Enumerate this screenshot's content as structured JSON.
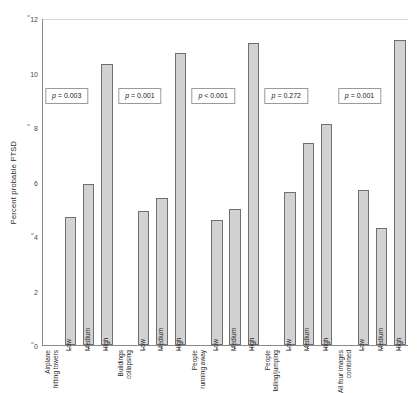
{
  "chart_data": {
    "type": "bar",
    "title": "",
    "xlabel": "",
    "ylabel": "Percent probable PTSD",
    "ylim": [
      0,
      12
    ],
    "yticks": [
      0,
      2,
      4,
      6,
      8,
      10,
      12
    ],
    "grid": false,
    "legend": "none",
    "categories": [
      "Low",
      "Medium",
      "High"
    ],
    "groups": [
      {
        "name": "Airplane hitting towers",
        "label_lines": [
          "Airplane",
          "hitting towers"
        ],
        "pvalue": "p = 0.003",
        "values": [
          4.7,
          5.9,
          10.3
        ]
      },
      {
        "name": "Buildings collapsing",
        "label_lines": [
          "Buildings",
          "collapsing"
        ],
        "pvalue": "p = 0.001",
        "values": [
          4.9,
          5.4,
          10.7
        ]
      },
      {
        "name": "People running away",
        "label_lines": [
          "People",
          "running away"
        ],
        "pvalue": "p < 0.001",
        "values": [
          4.6,
          5.0,
          11.1
        ]
      },
      {
        "name": "People falling/jumping",
        "label_lines": [
          "People",
          "falling/jumping"
        ],
        "pvalue": "p = 0.272",
        "values": [
          5.6,
          7.4,
          8.1
        ]
      },
      {
        "name": "All four images combined",
        "label_lines": [
          "All four images",
          "combined"
        ],
        "pvalue": "p = 0.001",
        "values": [
          5.7,
          4.3,
          11.2
        ]
      }
    ],
    "colors": {
      "bar_fill": "#d2d2d2",
      "bar_border": "#6f6f6f",
      "axis": "#8a8a8a",
      "text": "#2b2b2b"
    }
  }
}
